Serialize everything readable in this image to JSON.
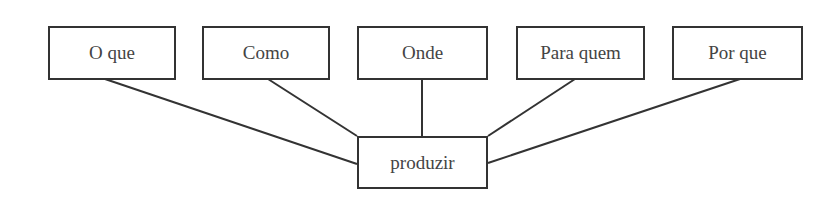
{
  "diagram": {
    "top_nodes": [
      {
        "label": "O que"
      },
      {
        "label": "Como"
      },
      {
        "label": "Onde"
      },
      {
        "label": "Para quem"
      },
      {
        "label": "Por que"
      }
    ],
    "center_node": {
      "label": "produzir"
    },
    "line_color": "#333333"
  }
}
